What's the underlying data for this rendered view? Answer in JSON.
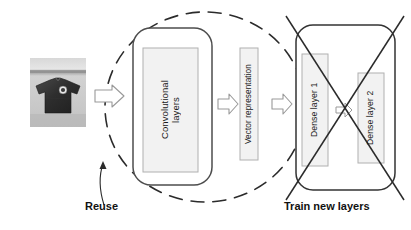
{
  "diagram": {
    "input_photo": {
      "name": "t-shirt-photo",
      "alt": "grayscale photograph of a dark short-sleeved t-shirt on a light surface"
    },
    "blocks": {
      "convolutional_layers": "Convolutional\nlayers",
      "vector_representation": "Vector representation",
      "dense_layer_1": "Dense layer 1",
      "dense_layer_2": "Dense layer 2"
    },
    "captions": {
      "reuse": "Reuse",
      "train_new_layers": "Train new layers"
    },
    "arrows": [
      {
        "name": "arrow-photo-to-conv"
      },
      {
        "name": "arrow-conv-to-vector"
      },
      {
        "name": "arrow-vector-to-dense"
      },
      {
        "name": "arrow-dense1-to-dense2"
      }
    ],
    "annotations": {
      "reuse_ellipse": "dashed-ellipse-around-convolutional-base",
      "cross_out": "x-cross-over-dense-layers",
      "reuse_pointer": "curved-arrow-from-reuse-label"
    },
    "colors": {
      "stroke_dark": "#333333",
      "stroke_gray": "#808080",
      "box_fill": "#f2f2f2",
      "box_stroke": "#b3b3b3",
      "text": "#1a1a1a",
      "background": "#ffffff"
    }
  }
}
